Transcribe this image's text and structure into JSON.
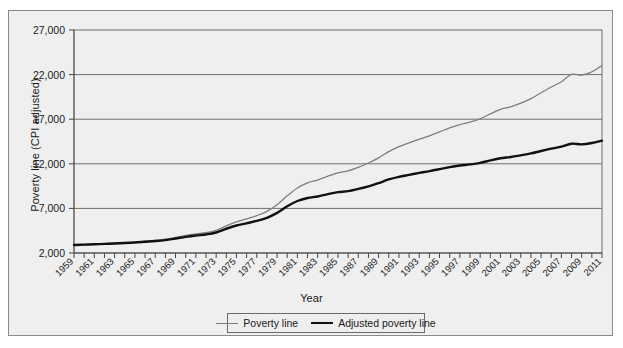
{
  "chart_data": {
    "type": "line",
    "title": "",
    "xlabel": "Year",
    "ylabel": "Poverty line (CPI adjusted)",
    "xlim": [
      1959,
      2011
    ],
    "ylim": [
      2000,
      27000
    ],
    "grid": true,
    "legend_position": "bottom",
    "ytick_labels": [
      "27,000",
      "22,000",
      "17,000",
      "12,000",
      "7,000",
      "2,000"
    ],
    "ytick_values": [
      27000,
      22000,
      17000,
      12000,
      7000,
      2000
    ],
    "xtick_labels": [
      "1959",
      "1961",
      "1963",
      "1965",
      "1967",
      "1969",
      "1971",
      "1973",
      "1975",
      "1977",
      "1979",
      "1981",
      "1983",
      "1985",
      "1987",
      "1989",
      "1991",
      "1993",
      "1995",
      "1997",
      "1999",
      "2001",
      "2003",
      "2005",
      "2007",
      "2009",
      "2011"
    ],
    "x": [
      1959,
      1960,
      1961,
      1962,
      1963,
      1964,
      1965,
      1966,
      1967,
      1968,
      1969,
      1970,
      1971,
      1972,
      1973,
      1974,
      1975,
      1976,
      1977,
      1978,
      1979,
      1980,
      1981,
      1982,
      1983,
      1984,
      1985,
      1986,
      1987,
      1988,
      1989,
      1990,
      1991,
      1992,
      1993,
      1994,
      1995,
      1996,
      1997,
      1998,
      1999,
      2000,
      2001,
      2002,
      2003,
      2004,
      2005,
      2006,
      2007,
      2008,
      2009,
      2010,
      2011
    ],
    "series": [
      {
        "name": "Poverty line",
        "color": "#7d7d7d",
        "line_width": 1.3,
        "values": [
          2900,
          2950,
          3000,
          3050,
          3100,
          3150,
          3220,
          3320,
          3420,
          3550,
          3750,
          3970,
          4140,
          4280,
          4540,
          5040,
          5500,
          5815,
          6190,
          6660,
          7410,
          8410,
          9290,
          9860,
          10180,
          10610,
          10990,
          11200,
          11610,
          12090,
          12670,
          13360,
          13920,
          14340,
          14760,
          15140,
          15570,
          16030,
          16400,
          16660,
          17030,
          17600,
          18100,
          18390,
          18810,
          19310,
          19970,
          20610,
          21200,
          22020,
          21950,
          22310,
          23020
        ]
      },
      {
        "name": "Adjusted poverty line",
        "color": "#111111",
        "line_width": 2.4,
        "values": [
          2900,
          2940,
          2980,
          3020,
          3070,
          3120,
          3180,
          3260,
          3340,
          3450,
          3620,
          3810,
          3960,
          4080,
          4300,
          4720,
          5080,
          5330,
          5600,
          5950,
          6500,
          7240,
          7830,
          8170,
          8340,
          8600,
          8820,
          8930,
          9180,
          9470,
          9840,
          10250,
          10540,
          10760,
          10980,
          11180,
          11400,
          11630,
          11810,
          11930,
          12100,
          12380,
          12620,
          12760,
          12950,
          13160,
          13440,
          13700,
          13920,
          14250,
          14180,
          14330,
          14600
        ]
      }
    ]
  }
}
